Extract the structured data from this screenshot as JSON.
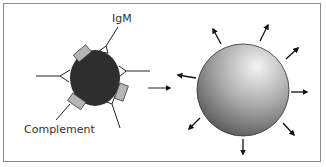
{
  "diagram": {
    "labels": {
      "igm": "IgM",
      "complement": "Complement"
    },
    "left_panel": {
      "description": "Dark cell coated with IgM antibodies and bound complement components",
      "cell_color": "#2e2e2e",
      "complement_color": "#b5b5b5"
    },
    "transition_arrow": "right-arrow",
    "right_panel": {
      "description": "Swollen lysed cell with arrows radiating outward",
      "sphere_gradient": [
        "#f2f2f2",
        "#8c8c8c",
        "#3a3a3a"
      ],
      "outward_arrow_count": 9
    },
    "colors": {
      "border": "#8a8a8a",
      "line": "#222222"
    }
  }
}
